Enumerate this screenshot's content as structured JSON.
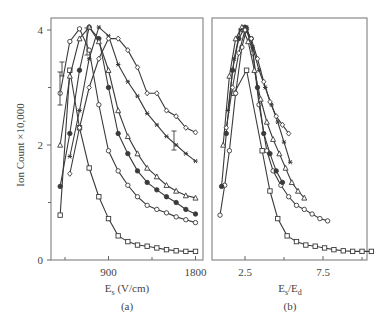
{
  "figure": {
    "y_axis_label": "Ion Count ×10,000",
    "panels": [
      {
        "id": "a",
        "caption": "(a)",
        "xlabel_main": "E",
        "xlabel_sub": "s",
        "xlabel_rest": " (V/cm)",
        "x_tick_labels": [
          {
            "value": 900,
            "label": "900"
          },
          {
            "value": 1800,
            "label": "1800"
          }
        ],
        "x_minor_ticks": [
          450,
          1350
        ],
        "y_tick_labels": [
          {
            "value": 0,
            "label": "0"
          },
          {
            "value": 2,
            "label": "2"
          },
          {
            "value": 4,
            "label": "4"
          }
        ],
        "y_minor_ticks": [
          1,
          3
        ]
      },
      {
        "id": "b",
        "caption": "(b)",
        "xlabel_main": "E",
        "xlabel_sub": "s",
        "xlabel_mid": "/E",
        "xlabel_sub2": "d",
        "x_tick_labels": [
          {
            "value": 2.5,
            "label": "2.5"
          },
          {
            "value": 7.5,
            "label": "7.5"
          }
        ],
        "x_minor_ticks": [
          5,
          10
        ]
      }
    ]
  },
  "chart_data": [
    {
      "type": "line",
      "title": "(a)",
      "xlabel": "Es (V/cm)",
      "ylabel": "Ion Count ×10,000",
      "xlim": [
        400,
        1850
      ],
      "ylim": [
        0,
        4.2
      ],
      "x_ticks": [
        900,
        1800
      ],
      "y_ticks": [
        0,
        2,
        4
      ],
      "grid": false,
      "legend": "none",
      "series": [
        {
          "name": "square",
          "marker": "square",
          "x": [
            400,
            500,
            600,
            700,
            800,
            900,
            1000,
            1100,
            1200,
            1300,
            1400,
            1500,
            1600,
            1700,
            1800
          ],
          "y": [
            0.78,
            3.3,
            2.3,
            1.6,
            1.1,
            0.72,
            0.42,
            0.32,
            0.26,
            0.24,
            0.21,
            0.18,
            0.16,
            0.15,
            0.15
          ]
        },
        {
          "name": "open-circle",
          "marker": "circle",
          "x": [
            400,
            500,
            600,
            700,
            800,
            900,
            1000,
            1100,
            1200,
            1300,
            1400,
            1500,
            1600,
            1700,
            1800
          ],
          "y": [
            2.9,
            3.8,
            4.02,
            3.65,
            2.7,
            1.9,
            1.55,
            1.3,
            1.1,
            0.95,
            0.88,
            0.82,
            0.75,
            0.7,
            0.65
          ]
        },
        {
          "name": "filled-circle",
          "marker": "circle-filled",
          "x": [
            400,
            500,
            600,
            700,
            800,
            900,
            1000,
            1100,
            1200,
            1300,
            1400,
            1500,
            1600,
            1700,
            1800
          ],
          "y": [
            1.28,
            2.2,
            3.3,
            4.05,
            3.85,
            3.0,
            2.2,
            1.85,
            1.55,
            1.35,
            1.22,
            1.1,
            1.0,
            0.88,
            0.8
          ]
        },
        {
          "name": "triangle",
          "marker": "triangle",
          "x": [
            400,
            500,
            600,
            700,
            800,
            900,
            1000,
            1100,
            1200,
            1300,
            1400,
            1500,
            1600,
            1700,
            1800
          ],
          "y": [
            2.0,
            3.2,
            3.85,
            4.05,
            3.8,
            3.3,
            2.6,
            2.15,
            1.85,
            1.6,
            1.45,
            1.3,
            1.2,
            1.12,
            1.08
          ]
        },
        {
          "name": "asterisk",
          "marker": "asterisk",
          "x": [
            500,
            600,
            700,
            800,
            900,
            1000,
            1100,
            1200,
            1300,
            1400,
            1500,
            1600,
            1700,
            1800
          ],
          "y": [
            1.8,
            2.6,
            3.5,
            4.05,
            3.9,
            3.4,
            3.1,
            2.85,
            2.55,
            2.35,
            2.15,
            2.0,
            1.85,
            1.72
          ]
        },
        {
          "name": "diamond",
          "marker": "diamond",
          "x": [
            500,
            600,
            700,
            800,
            900,
            1000,
            1100,
            1200,
            1300,
            1400,
            1500,
            1600,
            1700,
            1800
          ],
          "y": [
            1.5,
            2.3,
            3.0,
            3.5,
            3.85,
            3.85,
            3.65,
            3.35,
            2.9,
            2.9,
            2.6,
            2.5,
            2.3,
            2.22
          ]
        }
      ]
    },
    {
      "type": "line",
      "title": "(b)",
      "xlabel": "Es/Ed",
      "ylabel": "Ion Count ×10,000",
      "xlim": [
        0.7,
        11.0
      ],
      "ylim": [
        0,
        4.2
      ],
      "x_ticks": [
        2.5,
        7.5
      ],
      "grid": false,
      "legend": "none",
      "series": [
        {
          "name": "square",
          "marker": "square",
          "x": [
            1.8,
            2.6,
            3.6,
            4.1,
            4.6,
            5.2,
            5.8,
            6.4,
            7.0,
            7.6,
            8.2,
            8.8,
            9.4,
            10.0,
            10.6
          ],
          "y": [
            2.9,
            3.3,
            1.9,
            1.2,
            0.72,
            0.42,
            0.32,
            0.26,
            0.24,
            0.21,
            0.18,
            0.16,
            0.15,
            0.15,
            0.15
          ]
        },
        {
          "name": "open-circle",
          "marker": "circle",
          "x": [
            0.9,
            1.2,
            1.5,
            1.9,
            2.3,
            2.6,
            3.0,
            3.4,
            3.9,
            4.3,
            4.8,
            5.3,
            5.8,
            6.3,
            6.8,
            7.3,
            7.8
          ],
          "y": [
            0.78,
            1.3,
            1.9,
            2.9,
            3.7,
            4.02,
            3.6,
            2.7,
            1.9,
            1.55,
            1.3,
            1.1,
            0.95,
            0.88,
            0.8,
            0.72,
            0.68
          ]
        },
        {
          "name": "filled-circle",
          "marker": "circle-filled",
          "x": [
            1.0,
            1.3,
            1.7,
            2.1,
            2.5,
            2.9,
            3.3,
            3.7,
            4.1,
            4.5,
            4.9
          ],
          "y": [
            1.28,
            2.2,
            3.3,
            3.85,
            4.05,
            3.85,
            3.0,
            2.2,
            1.85,
            1.55,
            1.35
          ]
        },
        {
          "name": "triangle",
          "marker": "triangle",
          "x": [
            1.1,
            1.5,
            1.9,
            2.3,
            2.7,
            3.1,
            3.5,
            3.9,
            4.3,
            4.7,
            5.1,
            5.5,
            5.9,
            6.3
          ],
          "y": [
            2.0,
            3.2,
            3.85,
            4.05,
            3.8,
            3.3,
            2.8,
            2.4,
            2.1,
            1.85,
            1.6,
            1.35,
            1.2,
            1.08
          ]
        },
        {
          "name": "asterisk",
          "marker": "asterisk",
          "x": [
            1.4,
            1.8,
            2.2,
            2.6,
            3.0,
            3.4,
            3.8,
            4.2,
            4.6,
            5.0,
            5.4
          ],
          "y": [
            2.6,
            3.5,
            4.0,
            4.05,
            3.7,
            3.3,
            3.0,
            2.7,
            2.4,
            2.05,
            1.7
          ]
        },
        {
          "name": "diamond",
          "marker": "diamond",
          "x": [
            1.3,
            1.7,
            2.1,
            2.5,
            2.9,
            3.3,
            3.7,
            4.1,
            4.5,
            4.9,
            5.3
          ],
          "y": [
            2.3,
            3.0,
            3.6,
            4.0,
            3.85,
            3.5,
            3.1,
            2.75,
            2.5,
            2.35,
            2.2
          ]
        }
      ]
    }
  ]
}
